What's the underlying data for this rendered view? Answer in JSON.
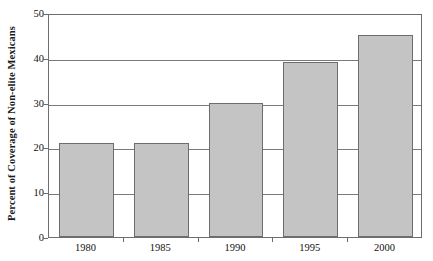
{
  "chart_data": {
    "type": "bar",
    "title": "",
    "xlabel": "",
    "ylabel": "Percent of Coverage of Non-elite Mexicans",
    "categories": [
      "1980",
      "1985",
      "1990",
      "1995",
      "2000"
    ],
    "values": [
      21,
      21,
      30,
      39,
      45
    ],
    "ylim": [
      0,
      50
    ],
    "yticks": [
      0,
      10,
      20,
      30,
      40,
      50
    ],
    "ytick_labels": [
      "0",
      "10",
      "20",
      "30",
      "40",
      "50"
    ],
    "grid": true,
    "grid_axis": "y",
    "legend": null,
    "legend_position": "none",
    "series": [
      {
        "name": "Percent of Coverage of Non-elite Mexicans",
        "values": [
          21,
          21,
          30,
          39,
          45
        ]
      }
    ],
    "colors": {
      "bar_fill": "#c4c4c4",
      "bar_edge": "#6d6d6d",
      "axis": "#6e6e6e",
      "grid": "#7a7a7a",
      "text": "#111111",
      "background": "#ffffff"
    }
  }
}
